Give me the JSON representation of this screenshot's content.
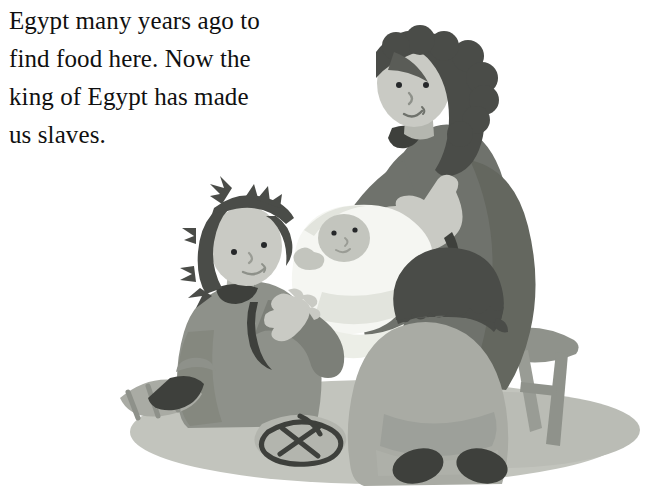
{
  "page": {
    "background_color": "#ffffff",
    "width": 654,
    "height": 496
  },
  "story_text": {
    "full_text": "Egypt many years ago to find food here. Now the king of Egypt has made us slaves.",
    "lines": [
      "Egypt many years ago to",
      "find food here. Now the",
      "king of Egypt has made",
      "us slaves."
    ],
    "color": "#101010"
  },
  "illustration": {
    "title": "Family scene with woman, baby and two children",
    "style": "flat grayscale cartoon illustration",
    "palette": {
      "white": "#ffffff",
      "swaddle_white": "#f5f6f2",
      "swaddle_shade": "#e2e4dd",
      "skin_light": "#c9cac4",
      "skin_shade": "#b4b6af",
      "ground_shadow": "#c2c4bd",
      "ground_shadow_dark": "#b3b5ae",
      "robe_light": "#a9aba4",
      "robe_mid": "#8e918a",
      "robe_dark": "#6f726c",
      "stool_wood": "#8f928b",
      "hair_dark": "#4a4c48",
      "outline_dark": "#3e403c"
    },
    "figures": [
      {
        "name": "woman",
        "description": "adult woman seated on a wooden stool, dark curly shoulder-length hair, light skin, dark gray robe, right hand resting open on her chest",
        "features": [
          "dark-curly-hair",
          "two-dot-eyes",
          "smile",
          "open-hand-on-chest",
          "dark-gray-robe"
        ]
      },
      {
        "name": "baby",
        "description": "infant swaddled in a white blanket lying across the woman's lap, small hand raised",
        "features": [
          "white-swaddle",
          "round-face",
          "two-dot-eyes",
          "raised-hand"
        ]
      },
      {
        "name": "girl",
        "description": "girl kneeling at the left, spiky dark shoulder-length hair, medium gray robe, hand reaching toward the baby, sandals on her feet",
        "features": [
          "spiky-dark-hair",
          "two-dot-eyes",
          "smile",
          "reaching-hand",
          "sandals"
        ]
      },
      {
        "name": "child-back",
        "description": "child seated on the ground seen from behind, dark bowl-cut hair, light gray robe, bare dark feet",
        "features": [
          "bowl-cut-hair",
          "light-gray-robe",
          "dark-feet"
        ]
      }
    ],
    "objects": [
      {
        "name": "stool",
        "description": "three-legged wooden stool with a cross brace under the woman"
      },
      {
        "name": "ground-shadow",
        "description": "large soft gray ellipse of shadow on the ground beneath the group"
      },
      {
        "name": "sandals",
        "description": "dark strappy sandals near the girl's feet at the lower left"
      }
    ]
  }
}
